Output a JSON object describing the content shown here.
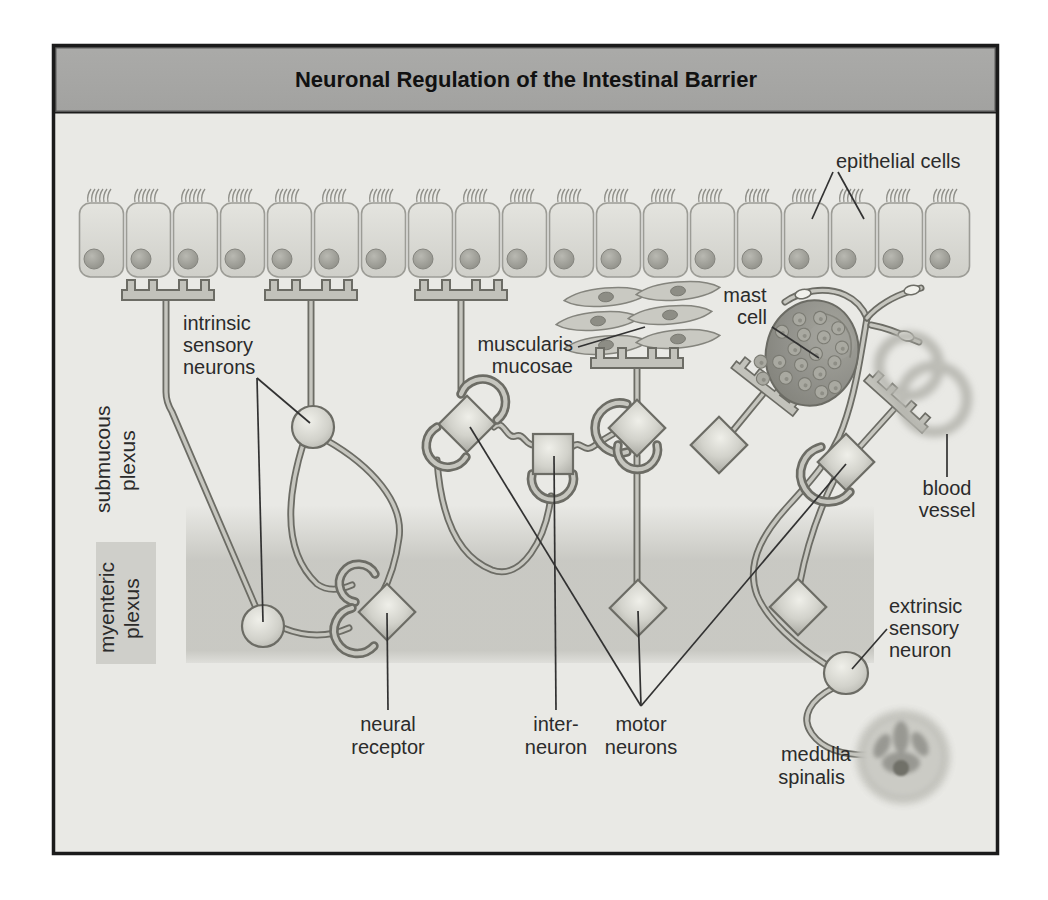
{
  "title": "Neuronal Regulation of the Intestinal Barrier",
  "labels": {
    "epithelial_cells": "epithelial cells",
    "intrinsic_sensory_neurons": [
      "intrinsic",
      "sensory",
      "neurons"
    ],
    "submucous_plexus": [
      "submucous",
      "plexus"
    ],
    "myenteric_plexus": [
      "myenteric",
      "plexus"
    ],
    "muscularis_mucosae": [
      "muscularis",
      "mucosae"
    ],
    "mast_cell": [
      "mast",
      "cell"
    ],
    "blood_vessel": [
      "blood",
      "vessel"
    ],
    "neural_receptor": [
      "neural",
      "receptor"
    ],
    "interneuron": [
      "inter-",
      "neuron"
    ],
    "motor_neurons": [
      "motor",
      "neurons"
    ],
    "extrinsic_sensory_neuron": [
      "extrinsic",
      "sensory",
      "neuron"
    ],
    "medulla_spinalis": [
      "medulla",
      "spinalis"
    ]
  },
  "colors": {
    "page_background": "#ffffff",
    "frame_border": "#1b1b1b",
    "title_bar": "#a6a6a4",
    "title_text": "#111111",
    "canvas": "#e9e9e5",
    "plexus_stripe": "#cbcbc4",
    "fiber_outline": "#6c6c65",
    "fiber_core": "#c6c6bf",
    "neuron_fill": "#cfcfc8",
    "mast_cell_fill": "#8b8b83",
    "label_text": "#2b2b2b"
  }
}
